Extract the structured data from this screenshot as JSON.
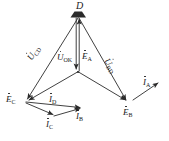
{
  "figure": {
    "type": "phasor-vector-diagram",
    "background_color": "#ffffff",
    "line_color": "#2b2b2b",
    "label_color": "#1a1a1a"
  },
  "nodes": {
    "D": {
      "label": "D",
      "x": 78,
      "y": 11,
      "marker": "filled-trapezoid"
    },
    "center": {
      "label": "",
      "x": 78,
      "y": 72,
      "marker": "junction"
    },
    "E_C": {
      "label": "C",
      "x": 24,
      "y": 100,
      "marker": "arrowhead"
    },
    "E_B": {
      "label": "B",
      "x": 128,
      "y": 102,
      "marker": "arrowhead"
    },
    "I_B_tip": {
      "label": "",
      "x": 82,
      "y": 110,
      "marker": "arrowhead"
    },
    "I_C_tip": {
      "label": "",
      "x": 55,
      "y": 115,
      "marker": "arrowhead"
    },
    "I_A_tip": {
      "label": "",
      "x": 157,
      "y": 84,
      "marker": "arrowhead"
    }
  },
  "labels": {
    "node_D": {
      "text": "D",
      "dotted": false,
      "sub": ""
    },
    "u_cd": {
      "text": "U",
      "dotted": true,
      "sub": "CD"
    },
    "u_ok": {
      "text": "U",
      "dotted": true,
      "sub": "OK"
    },
    "e_a": {
      "text": "E",
      "dotted": true,
      "sub": "A"
    },
    "u_bd": {
      "text": "U",
      "dotted": true,
      "sub": "BD"
    },
    "e_c": {
      "text": "E",
      "dotted": true,
      "sub": "C"
    },
    "e_b": {
      "text": "E",
      "dotted": true,
      "sub": "B"
    },
    "i_d": {
      "text": "I",
      "dotted": true,
      "sub": "D"
    },
    "i_c": {
      "text": "I",
      "dotted": true,
      "sub": "C"
    },
    "i_b": {
      "text": "I",
      "dotted": true,
      "sub": "B"
    },
    "i_a": {
      "text": "I",
      "dotted": true,
      "sub": "A"
    }
  },
  "vectors": [
    {
      "name": "U_CD",
      "from": "D",
      "to": "E_C",
      "label": "u_cd"
    },
    {
      "name": "U_OK",
      "from": "D",
      "to": "center",
      "label": "u_ok"
    },
    {
      "name": "E_A",
      "from": "center",
      "to": "D",
      "label": "e_a"
    },
    {
      "name": "U_BD",
      "from": "D",
      "to": "E_B",
      "label": "u_bd"
    },
    {
      "name": "E_C_branch",
      "from": "center",
      "to": "E_C",
      "label": "e_c"
    },
    {
      "name": "E_B_branch",
      "from": "center",
      "to": "E_B",
      "label": "e_b"
    },
    {
      "name": "I_D",
      "from": "E_C",
      "to": "I_B_tip",
      "label": "i_d"
    },
    {
      "name": "I_C",
      "from": "E_C",
      "to": "I_C_tip",
      "label": "i_c"
    },
    {
      "name": "I_B",
      "from": "I_C_tip",
      "to": "I_B_tip",
      "label": "i_b"
    },
    {
      "name": "I_A",
      "from": "E_B",
      "to": "I_A_tip",
      "label": "i_a"
    }
  ],
  "label_positions": {
    "node_D": {
      "x": 76,
      "y": 1
    },
    "u_cd": {
      "x": 26,
      "y": 57
    },
    "u_ok": {
      "x": 59,
      "y": 53
    },
    "e_a": {
      "x": 78,
      "y": 52
    },
    "u_bd": {
      "x": 110,
      "y": 57
    },
    "e_c": {
      "x": 7,
      "y": 95
    },
    "e_b": {
      "x": 124,
      "y": 110
    },
    "i_d": {
      "x": 49,
      "y": 96
    },
    "i_c": {
      "x": 46,
      "y": 121
    },
    "i_b": {
      "x": 75,
      "y": 114
    },
    "i_a": {
      "x": 144,
      "y": 79
    }
  }
}
